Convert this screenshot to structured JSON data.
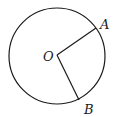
{
  "diagram": {
    "type": "circle-with-radii",
    "circle": {
      "cx": 57,
      "cy": 56,
      "r": 48,
      "stroke": "#1a1a1a"
    },
    "center": {
      "label": "O",
      "x": 57,
      "y": 55
    },
    "points": [
      {
        "label": "A",
        "x": 96,
        "y": 28
      },
      {
        "label": "B",
        "x": 79,
        "y": 100
      }
    ],
    "segments": [
      "OA",
      "OB"
    ]
  }
}
